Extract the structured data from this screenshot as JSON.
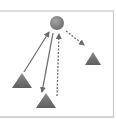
{
  "diagram": {
    "colors": {
      "frame": "#b8b8b8",
      "node_fill": "#7d7d7d",
      "node_highlight": "#a6a6a6",
      "triangle_fill": "#6e6e6e",
      "arrow": "#707070",
      "background": "#ffffff"
    },
    "nodes": [
      {
        "id": "hub",
        "shape": "circle",
        "cx": 57,
        "cy": 23,
        "r": 7
      },
      {
        "id": "left",
        "shape": "triangle",
        "points": "22,73 12,88 32,88"
      },
      {
        "id": "bottom",
        "shape": "triangle",
        "points": "46,93 36,108 56,108"
      },
      {
        "id": "right",
        "shape": "triangle",
        "points": "93,52 85,65 101,65"
      }
    ],
    "edges": [
      {
        "from": "left",
        "to": "hub",
        "style": "solid",
        "x1": 24,
        "y1": 72,
        "x2": 49,
        "y2": 32
      },
      {
        "from": "hub",
        "to": "bottom",
        "style": "solid",
        "x1": 53,
        "y1": 33,
        "x2": 42,
        "y2": 92
      },
      {
        "from": "bottom",
        "to": "hub",
        "style": "dashed",
        "x1": 57,
        "y1": 96,
        "x2": 59,
        "y2": 34
      },
      {
        "from": "hub",
        "to": "right",
        "style": "dashed",
        "x1": 66,
        "y1": 31,
        "x2": 84,
        "y2": 45
      }
    ]
  }
}
